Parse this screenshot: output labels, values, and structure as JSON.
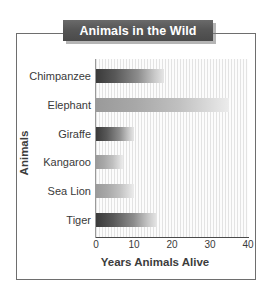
{
  "figure": {
    "title": "Animals in the Wild",
    "frame_color": "#6e6e6e",
    "banner_color": "#565656",
    "banner_text_color": "#ffffff"
  },
  "chart_data": {
    "type": "bar",
    "orientation": "horizontal",
    "title": "Animals in the Wild",
    "xlabel": "Years Animals Alive",
    "ylabel": "Animals",
    "categories": [
      "Chimpanzee",
      "Elephant",
      "Giraffe",
      "Kangaroo",
      "Sea Lion",
      "Tiger"
    ],
    "values": [
      18,
      35,
      10,
      7,
      10,
      16
    ],
    "xlim": [
      0,
      40
    ],
    "xticks": [
      0,
      10,
      20,
      30,
      40
    ],
    "xtick_labels": [
      "0",
      "10",
      "20",
      "30",
      "40"
    ],
    "grid": false,
    "legend": null,
    "bar_style": "gradient dark-to-light, left to right",
    "plot_background": "white with fine vertical light gray stripes",
    "series": [
      {
        "name": "Years Animals Alive",
        "points": [
          {
            "category": "Chimpanzee",
            "value": 18,
            "shade": "dark"
          },
          {
            "category": "Elephant",
            "value": 35,
            "shade": "light"
          },
          {
            "category": "Giraffe",
            "value": 10,
            "shade": "dark"
          },
          {
            "category": "Kangaroo",
            "value": 7,
            "shade": "light"
          },
          {
            "category": "Sea Lion",
            "value": 10,
            "shade": "light"
          },
          {
            "category": "Tiger",
            "value": 16,
            "shade": "dark"
          }
        ]
      }
    ]
  }
}
